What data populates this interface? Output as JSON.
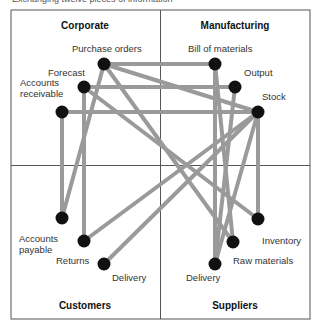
{
  "caption": "Exchanging twelve pieces of information",
  "colors": {
    "frame": "#555555",
    "edge": "#9a9a9a",
    "node": "#111111"
  },
  "quadrants": [
    {
      "id": "corporate",
      "label": "Corporate",
      "x": 85,
      "y": 26
    },
    {
      "id": "manufacturing",
      "label": "Manufacturing",
      "x": 235,
      "y": 26
    },
    {
      "id": "customers",
      "label": "Customers",
      "x": 85,
      "y": 306
    },
    {
      "id": "suppliers",
      "label": "Suppliers",
      "x": 235,
      "y": 306
    }
  ],
  "nodes": [
    {
      "id": "purchase_orders",
      "label": "Purchase orders",
      "x": 104,
      "y": 64,
      "lx": 72,
      "ly": 43
    },
    {
      "id": "forecast",
      "label": "Forecast",
      "x": 84,
      "y": 87,
      "lx": 48,
      "ly": 67
    },
    {
      "id": "accounts_receivable",
      "label": "Accounts\nreceivable",
      "x": 62,
      "y": 112,
      "lx": 20,
      "ly": 77
    },
    {
      "id": "bill_of_materials",
      "label": "Bill of materials",
      "x": 215,
      "y": 64,
      "lx": 188,
      "ly": 43
    },
    {
      "id": "output",
      "label": "Output",
      "x": 235,
      "y": 87,
      "lx": 244,
      "ly": 67
    },
    {
      "id": "stock",
      "label": "Stock",
      "x": 258,
      "y": 112,
      "lx": 262,
      "ly": 91
    },
    {
      "id": "accounts_payable",
      "label": "Accounts\npayable",
      "x": 62,
      "y": 218,
      "lx": 19,
      "ly": 233
    },
    {
      "id": "returns",
      "label": "Returns",
      "x": 84,
      "y": 241,
      "lx": 56,
      "ly": 255
    },
    {
      "id": "delivery_customers",
      "label": "Delivery",
      "x": 104,
      "y": 264,
      "lx": 112,
      "ly": 272
    },
    {
      "id": "inventory",
      "label": "Inventory",
      "x": 258,
      "y": 219,
      "lx": 262,
      "ly": 235
    },
    {
      "id": "raw_materials",
      "label": "Raw materials",
      "x": 233,
      "y": 242,
      "lx": 233,
      "ly": 255
    },
    {
      "id": "delivery_suppliers",
      "label": "Delivery",
      "x": 215,
      "y": 264,
      "lx": 186,
      "ly": 272
    }
  ],
  "edges": [
    [
      "purchase_orders",
      "bill_of_materials"
    ],
    [
      "purchase_orders",
      "stock"
    ],
    [
      "purchase_orders",
      "raw_materials"
    ],
    [
      "purchase_orders",
      "accounts_payable"
    ],
    [
      "forecast",
      "output"
    ],
    [
      "forecast",
      "returns"
    ],
    [
      "forecast",
      "inventory"
    ],
    [
      "accounts_receivable",
      "stock"
    ],
    [
      "accounts_receivable",
      "accounts_payable"
    ],
    [
      "bill_of_materials",
      "delivery_suppliers"
    ],
    [
      "output",
      "delivery_suppliers"
    ],
    [
      "bill_of_materials",
      "raw_materials"
    ],
    [
      "stock",
      "inventory"
    ],
    [
      "stock",
      "returns"
    ],
    [
      "stock",
      "delivery_customers"
    ],
    [
      "stock",
      "delivery_suppliers"
    ]
  ]
}
